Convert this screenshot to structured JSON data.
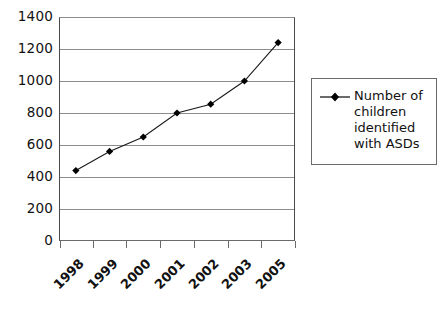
{
  "chart_data": {
    "type": "line",
    "title": "",
    "xlabel": "",
    "ylabel": "",
    "categories": [
      "1998",
      "1999",
      "2000",
      "2001",
      "2002",
      "2003",
      "2005"
    ],
    "values": [
      440,
      560,
      650,
      800,
      855,
      1000,
      1240
    ],
    "series": [
      {
        "name": "Number of children identified with ASDs",
        "values": [
          440,
          560,
          650,
          800,
          855,
          1000,
          1240
        ]
      }
    ],
    "ylim": [
      0,
      1400
    ],
    "yticks": [
      0,
      200,
      400,
      600,
      800,
      1000,
      1200,
      1400
    ],
    "ytick_labels": [
      "0",
      "200",
      "400",
      "600",
      "800",
      "1000",
      "1200",
      "1400"
    ],
    "grid": "horizontal",
    "legend_position": "right",
    "marker": "diamond",
    "line_color": "#1a1a1a",
    "marker_color": "#000000",
    "grid_color": "#8d8d8d",
    "background_color": "#ffffff"
  },
  "legend": {
    "entries": [
      {
        "marker": "diamond-line-marker",
        "lines": [
          "Number of",
          "children",
          "identified",
          "with ASDs"
        ],
        "label": "Number of children identified with ASDs"
      }
    ]
  }
}
